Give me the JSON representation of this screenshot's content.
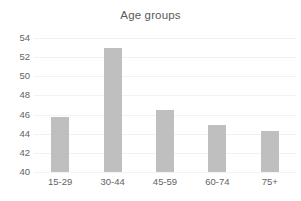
{
  "chart_data": {
    "type": "bar",
    "title": "Age groups",
    "xlabel": "",
    "ylabel": "",
    "categories": [
      "15-29",
      "30-44",
      "45-59",
      "60-74",
      "75+"
    ],
    "values": [
      45.8,
      53.0,
      46.5,
      44.9,
      44.3
    ],
    "ylim": [
      40,
      54
    ],
    "yticks": [
      40,
      42,
      44,
      46,
      48,
      50,
      52,
      54
    ],
    "ytick_labels": [
      "40",
      "42",
      "44",
      "46",
      "48",
      "50",
      "52",
      "54"
    ],
    "grid": true,
    "grid_axis": "y",
    "legend": false,
    "legend_position": "none",
    "bar_color": "#bfbfbf",
    "grid_color": "#f2f2f2",
    "text_color": "#636363",
    "title_color": "#595959",
    "background_color": "#ffffff"
  }
}
